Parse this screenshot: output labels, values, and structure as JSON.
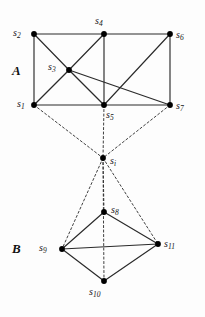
{
  "figure": {
    "width": 205,
    "height": 317,
    "background": "#fdfdfd",
    "edge_color": "#2a2a2a",
    "node_color": "#000000"
  },
  "groups": [
    {
      "id": "group-a",
      "label": "A",
      "x": 12,
      "y": 64
    },
    {
      "id": "group-b",
      "label": "B",
      "x": 12,
      "y": 242
    }
  ],
  "nodes": [
    {
      "id": "s1",
      "base": "s",
      "sub": "1",
      "x": 34,
      "y": 105,
      "label_x": 17,
      "label_y": 99,
      "group": "A"
    },
    {
      "id": "s2",
      "base": "s",
      "sub": "2",
      "x": 34,
      "y": 34,
      "label_x": 13,
      "label_y": 28,
      "group": "A"
    },
    {
      "id": "s3",
      "base": "s",
      "sub": "3",
      "x": 69,
      "y": 70,
      "label_x": 48,
      "label_y": 62,
      "group": "A"
    },
    {
      "id": "s4",
      "base": "s",
      "sub": "4",
      "x": 104,
      "y": 34,
      "label_x": 95,
      "label_y": 16,
      "group": "A"
    },
    {
      "id": "s5",
      "base": "s",
      "sub": "5",
      "x": 104,
      "y": 105,
      "label_x": 106,
      "label_y": 110,
      "group": "A"
    },
    {
      "id": "s6",
      "base": "s",
      "sub": "6",
      "x": 170,
      "y": 34,
      "label_x": 176,
      "label_y": 30,
      "group": "A"
    },
    {
      "id": "s7",
      "base": "s",
      "sub": "7",
      "x": 170,
      "y": 105,
      "label_x": 176,
      "label_y": 101,
      "group": "A"
    },
    {
      "id": "si",
      "base": "s",
      "sub": "i",
      "x": 103,
      "y": 158,
      "label_x": 110,
      "label_y": 156,
      "group": "link"
    },
    {
      "id": "s8",
      "base": "s",
      "sub": "8",
      "x": 104,
      "y": 212,
      "label_x": 111,
      "label_y": 205,
      "group": "B"
    },
    {
      "id": "s9",
      "base": "s",
      "sub": "9",
      "x": 62,
      "y": 249,
      "label_x": 39,
      "label_y": 243,
      "group": "B"
    },
    {
      "id": "s10",
      "base": "s",
      "sub": "10",
      "x": 104,
      "y": 281,
      "label_x": 89,
      "label_y": 287,
      "group": "B"
    },
    {
      "id": "s11",
      "base": "s",
      "sub": "11",
      "x": 158,
      "y": 244,
      "label_x": 164,
      "label_y": 239,
      "group": "B"
    }
  ],
  "edges_solid": [
    {
      "from": "s1",
      "to": "s2"
    },
    {
      "from": "s2",
      "to": "s4"
    },
    {
      "from": "s4",
      "to": "s6"
    },
    {
      "from": "s6",
      "to": "s7"
    },
    {
      "from": "s1",
      "to": "s5"
    },
    {
      "from": "s5",
      "to": "s7"
    },
    {
      "from": "s2",
      "to": "s3"
    },
    {
      "from": "s3",
      "to": "s1"
    },
    {
      "from": "s3",
      "to": "s4"
    },
    {
      "from": "s3",
      "to": "s5"
    },
    {
      "from": "s3",
      "to": "s7"
    },
    {
      "from": "s4",
      "to": "s5"
    },
    {
      "from": "s5",
      "to": "s6"
    },
    {
      "from": "s8",
      "to": "s9"
    },
    {
      "from": "s8",
      "to": "s11"
    },
    {
      "from": "s9",
      "to": "s11"
    },
    {
      "from": "s9",
      "to": "s10"
    },
    {
      "from": "s10",
      "to": "s11"
    }
  ],
  "edges_dashed": [
    {
      "from": "s1",
      "to": "si"
    },
    {
      "from": "s5",
      "to": "si"
    },
    {
      "from": "s7",
      "to": "si"
    },
    {
      "from": "si",
      "to": "s8"
    },
    {
      "from": "si",
      "to": "s9"
    },
    {
      "from": "si",
      "to": "s10"
    },
    {
      "from": "si",
      "to": "s11"
    }
  ]
}
